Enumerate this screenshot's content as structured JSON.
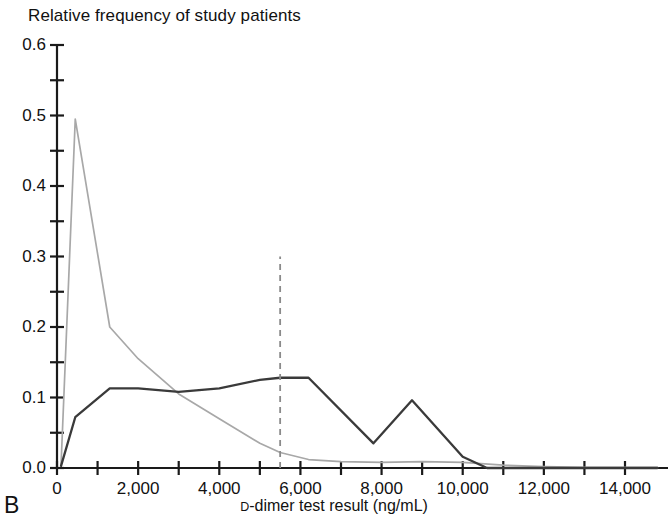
{
  "figure": {
    "panel_label": "B",
    "title": "Relative frequency of study patients",
    "xlabel_prefix": "D",
    "xlabel_rest": "-dimer test result (ng/mL)"
  },
  "axes": {
    "y_ticks": [
      "0.0",
      "0.1",
      "0.2",
      "0.3",
      "0.4",
      "0.5",
      "0.6"
    ],
    "x_ticks": [
      "0",
      "2,000",
      "4,000",
      "6,000",
      "8,000",
      "10,000",
      "12,000",
      "14,000"
    ]
  },
  "colors": {
    "dark_series": "#3a3a3a",
    "light_series": "#a8a8a8",
    "threshold_line": "#8a8a8a",
    "axis": "#1a1a1a",
    "text": "#111111"
  },
  "chart_data": {
    "type": "line",
    "title": "Relative frequency of study patients",
    "xlabel": "D-dimer test result (ng/mL)",
    "ylabel": "Relative frequency of study patients",
    "xlim": [
      0,
      14800
    ],
    "ylim": [
      0.0,
      0.6
    ],
    "xticks": [
      0,
      2000,
      4000,
      6000,
      8000,
      10000,
      12000,
      14000
    ],
    "xtick_labels": [
      "0",
      "2,000",
      "4,000",
      "6,000",
      "8,000",
      "10,000",
      "12,000",
      "14,000"
    ],
    "yticks": [
      0.0,
      0.1,
      0.2,
      0.3,
      0.4,
      0.5,
      0.6
    ],
    "ytick_labels": [
      "0.0",
      "0.1",
      "0.2",
      "0.3",
      "0.4",
      "0.5",
      "0.6"
    ],
    "yticks_minor": [
      0.05,
      0.15,
      0.25,
      0.35,
      0.45,
      0.55
    ],
    "grid": false,
    "legend": null,
    "annotations": [
      {
        "type": "vertical-dashed-line",
        "name": "d-dimer-threshold",
        "x": 5500,
        "y_from": 0.0,
        "y_to": 0.3
      },
      {
        "type": "panel-label",
        "text": "B"
      }
    ],
    "series": [
      {
        "name": "light-curve",
        "color": "#a8a8a8",
        "x": [
          100,
          450,
          1300,
          2000,
          3000,
          4000,
          5000,
          5500,
          6200,
          7000,
          8000,
          9000,
          10000,
          11000,
          12000,
          13000,
          14000,
          14800
        ],
        "y": [
          0.005,
          0.495,
          0.2,
          0.155,
          0.105,
          0.07,
          0.035,
          0.022,
          0.012,
          0.009,
          0.008,
          0.009,
          0.008,
          0.004,
          0.002,
          0.001,
          0.001,
          0.001
        ]
      },
      {
        "name": "dark-curve",
        "color": "#3a3a3a",
        "x": [
          100,
          450,
          1300,
          2000,
          3000,
          4000,
          5000,
          5500,
          6200,
          7800,
          8750,
          10000,
          10600,
          11500,
          12500,
          13500,
          14800
        ],
        "y": [
          0.003,
          0.072,
          0.113,
          0.113,
          0.108,
          0.113,
          0.125,
          0.128,
          0.128,
          0.035,
          0.096,
          0.016,
          0.0,
          0.0,
          0.0,
          0.0,
          0.0
        ]
      }
    ]
  }
}
